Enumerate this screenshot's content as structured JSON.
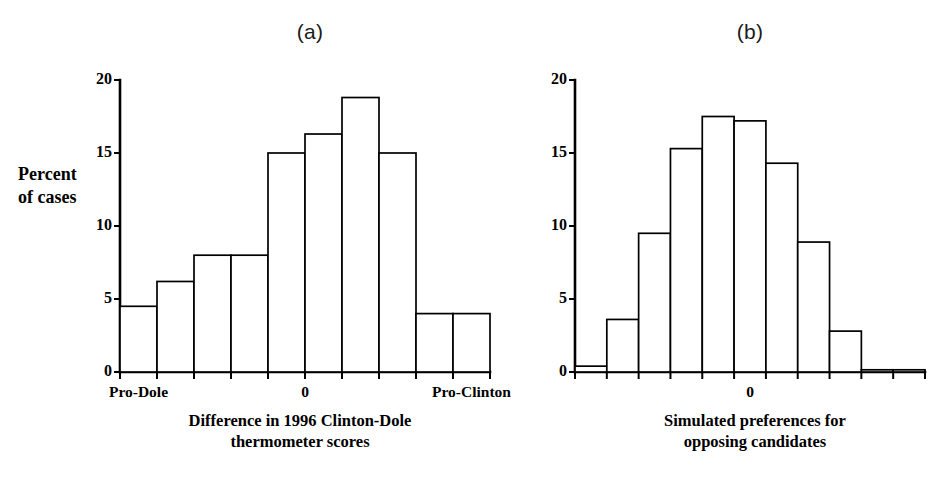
{
  "figure": {
    "panels": [
      {
        "id": "a",
        "title": "(a)",
        "caption_line1": "Difference in 1996 Clinton-Dole",
        "caption_line2": "thermometer scores",
        "xtick_labels": [
          "Pro-Dole",
          "0",
          "Pro-Clinton"
        ]
      },
      {
        "id": "b",
        "title": "(b)",
        "caption_line1": "Simulated preferences for",
        "caption_line2": "opposing candidates",
        "xtick_labels": [
          "0"
        ]
      }
    ],
    "ylabel_line1": "Percent",
    "ylabel_line2": "of cases",
    "ytick_labels": [
      "0",
      "5",
      "10",
      "15",
      "20"
    ],
    "colors": {
      "bar_fill": "#ffffff",
      "bar_stroke": "#000000",
      "axis": "#000000",
      "text": "#000000"
    }
  },
  "chart_data": [
    {
      "type": "bar",
      "title": "(a)",
      "xlabel": "Difference in 1996 Clinton-Dole thermometer scores",
      "ylabel": "Percent of cases",
      "ylim": [
        0,
        20
      ],
      "yticks": [
        0,
        5,
        10,
        15,
        20
      ],
      "grid": false,
      "legend": "none",
      "categories": [
        "bin1",
        "bin2",
        "bin3",
        "bin4",
        "bin5",
        "bin6",
        "bin7",
        "bin8",
        "bin9",
        "bin10"
      ],
      "xtick_labels": [
        "Pro-Dole",
        "0",
        "Pro-Clinton"
      ],
      "xtick_positions": [
        0.5,
        5.0,
        9.5
      ],
      "values": [
        4.5,
        6.2,
        8.0,
        8.0,
        15.0,
        16.3,
        18.8,
        15.0,
        4.0,
        4.0
      ]
    },
    {
      "type": "bar",
      "title": "(b)",
      "xlabel": "Simulated preferences for opposing candidates",
      "ylabel": "Percent of cases",
      "ylim": [
        0,
        20
      ],
      "yticks": [
        0,
        5,
        10,
        15,
        20
      ],
      "grid": false,
      "legend": "none",
      "categories": [
        "bin1",
        "bin2",
        "bin3",
        "bin4",
        "bin5",
        "bin6",
        "bin7",
        "bin8",
        "bin9",
        "bin10",
        "bin11"
      ],
      "xtick_labels": [
        "0"
      ],
      "xtick_positions": [
        5.5
      ],
      "values": [
        0.4,
        3.6,
        9.5,
        15.3,
        17.5,
        17.2,
        14.3,
        8.9,
        2.8,
        0.15,
        0.15
      ]
    }
  ]
}
